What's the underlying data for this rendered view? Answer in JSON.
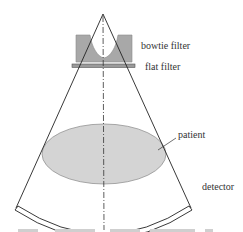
{
  "diagram": {
    "type": "CT fan-beam geometry schematic",
    "labels": {
      "bowtie_filter": "bowtie filter",
      "flat_filter": "flat filter",
      "patient": "patient",
      "detector": "detector"
    },
    "colors": {
      "line": "#222222",
      "filter_fill": "#a8a8a8",
      "patient_fill": "#d4d4d4",
      "patient_stroke": "#8a8a8a",
      "background": "#ffffff"
    }
  }
}
